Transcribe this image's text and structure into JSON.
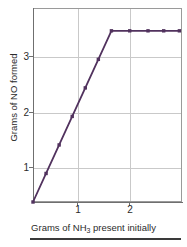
{
  "chart_data": {
    "type": "line",
    "title": "",
    "xlabel": "Grams of NH3 present initially",
    "xlabel_parts": {
      "pre": "Grams of NH",
      "sub": "3",
      "post": " present initially"
    },
    "ylabel": "Grams of NO formed",
    "xlim": [
      0,
      2.85
    ],
    "ylim": [
      0,
      3.4
    ],
    "xticks": [
      1,
      2
    ],
    "xticklabels": [
      "1",
      "2"
    ],
    "yticks": [
      1,
      2,
      3
    ],
    "yticklabels": [
      "1",
      "2",
      "3"
    ],
    "grid": true,
    "grid_color": "#c9c9c9",
    "legend": false,
    "series": [
      {
        "name": "Grams of NO formed",
        "color": "#51325e",
        "marker": "square",
        "x": [
          0.0,
          0.25,
          0.5,
          0.75,
          1.0,
          1.25,
          1.5,
          1.85,
          2.2,
          2.5,
          2.8
        ],
        "y": [
          0.0,
          0.5,
          1.0,
          1.5,
          2.0,
          2.5,
          3.0,
          3.0,
          3.0,
          3.0,
          3.0
        ]
      }
    ],
    "annotations": [
      {
        "text": "plateau at 3 grams NO",
        "x": 2.0,
        "y": 3.0,
        "visible": false
      }
    ]
  },
  "axis": {
    "y_ticks": [
      {
        "label": "3",
        "value": 3
      },
      {
        "label": "2",
        "value": 2
      },
      {
        "label": "1",
        "value": 1
      }
    ],
    "x_ticks": [
      {
        "label": "1",
        "value": 1
      },
      {
        "label": "2",
        "value": 2
      }
    ]
  },
  "colors": {
    "series": "#51325e",
    "grid": "#c9c9c9",
    "axis": "#6f6f6f",
    "text": "#2b2b2b",
    "rule": "#3a3a3a",
    "background": "#ffffff"
  }
}
